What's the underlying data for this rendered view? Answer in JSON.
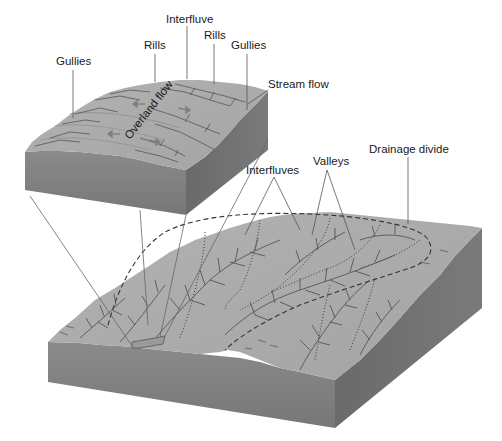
{
  "figure": {
    "type": "block-diagram"
  },
  "inset": {
    "labels": {
      "gullies_left": "Gullies",
      "rills_left": "Rills",
      "interfluve": "Interfluve",
      "rills_right": "Rills",
      "gullies_right": "Gullies",
      "stream_flow": "Stream flow",
      "overland_flow": "Overland flow"
    }
  },
  "main_block": {
    "labels": {
      "interfluves": "Interfluves",
      "valleys": "Valleys",
      "drainage_divide": "Drainage divide"
    }
  },
  "colors": {
    "surface": "#a9a9a9",
    "surface_light": "#b4b4b4",
    "side_front": "#808080",
    "side_right": "#6e6e6e",
    "channel": "#4a4a4a",
    "leader": "#555555",
    "text": "#1a1a1a"
  }
}
